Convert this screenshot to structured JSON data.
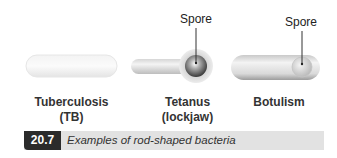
{
  "figure": {
    "number": "20.7",
    "caption": "Examples of rod-shaped bacteria"
  },
  "bacteria": [
    {
      "name_line1": "Tuberculosis",
      "name_line2": "(TB)",
      "has_spore": false
    },
    {
      "name_line1": "Tetanus",
      "name_line2": "(lockjaw)",
      "has_spore": true,
      "spore_label": "Spore",
      "spore_position": "terminal"
    },
    {
      "name_line1": "Botulism",
      "name_line2": "",
      "has_spore": true,
      "spore_label": "Spore",
      "spore_position": "subterminal"
    }
  ],
  "colors": {
    "caption_number_bg": "#2b2b2b",
    "caption_bg": "#e2e2e2",
    "cell_light": "#f2f2f2",
    "cell_shadow": "#c8c8c8",
    "spore_dark": "#555555"
  }
}
